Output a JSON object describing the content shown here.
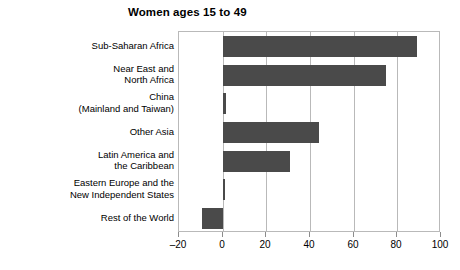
{
  "chart_data": {
    "type": "bar",
    "orientation": "horizontal",
    "title": "Women ages 15 to 49",
    "xlabel": "",
    "ylabel": "",
    "xlim": [
      -20,
      100
    ],
    "xticks": [
      -20,
      0,
      20,
      40,
      60,
      80,
      100
    ],
    "xtick_labels": [
      "–20",
      "0",
      "20",
      "40",
      "60",
      "80",
      "100"
    ],
    "grid": "vertical",
    "legend": "none",
    "bar_color": "#4a4a4a",
    "axis_color": "#b9b9b9",
    "categories": [
      "Sub-Saharan Africa",
      "Near East and\nNorth Africa",
      "China\n(Mainland and Taiwan)",
      "Other Asia",
      "Latin America and\nthe Caribbean",
      "Eastern Europe and the\nNew Independent States",
      "Rest of the World"
    ],
    "values": [
      89,
      75,
      1.5,
      44,
      31,
      1,
      -9.5
    ]
  }
}
